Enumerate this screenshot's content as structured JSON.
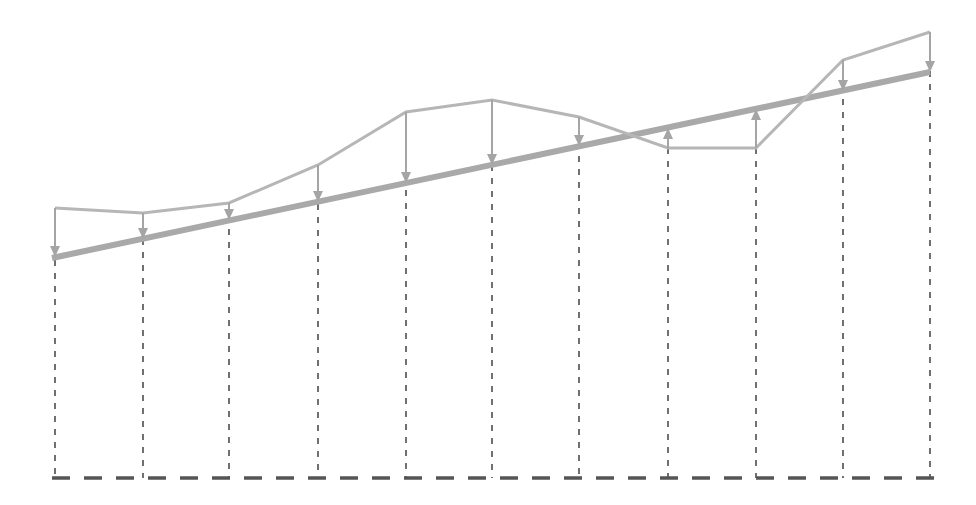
{
  "canvas": {
    "width": 976,
    "height": 505,
    "background": "#ffffff"
  },
  "colors": {
    "trend_line": "#a9a9a9",
    "series_line": "#b6b6b6",
    "arrow": "#a5a5a5",
    "guide_line": "#4d4d4d",
    "baseline": "#555555"
  },
  "style": {
    "trend_width": 6,
    "series_width": 3,
    "arrow_width": 2,
    "guide_width": 1.6,
    "guide_dash": "6 7",
    "baseline_width": 3.4,
    "baseline_dash": "18 14"
  },
  "chart_data": {
    "type": "line",
    "title": "",
    "subtitle": "",
    "xlabel": "",
    "ylabel": "",
    "grid": false,
    "legend_position": "none",
    "axis_note": "No axis tick labels or numeric annotations are rendered in the figure; geometry is given in pixel coordinates of the 976x505 canvas.",
    "xlim": [
      0,
      976
    ],
    "ylim": [
      505,
      0
    ],
    "baseline": {
      "y": 478,
      "x_start": 52,
      "x_end": 935,
      "dashed": true
    },
    "categories": [
      "1",
      "2",
      "3",
      "4",
      "5",
      "6",
      "7",
      "8",
      "9",
      "10",
      "11"
    ],
    "x": [
      55,
      143,
      229,
      318,
      406,
      492,
      579,
      668,
      756,
      843,
      930
    ],
    "series": [
      {
        "name": "actual",
        "style": "zigzag-line",
        "values": [
          208,
          213,
          203,
          165,
          112,
          100,
          117,
          148,
          148,
          60,
          32
        ]
      },
      {
        "name": "trend",
        "style": "thick-straight-line",
        "endpoints": [
          {
            "x": 52,
            "y": 258
          },
          {
            "x": 930,
            "y": 72
          }
        ],
        "values": [
          257,
          239,
          220,
          202,
          183,
          165,
          146,
          128,
          109,
          91,
          72
        ]
      }
    ],
    "deviation_arrows": [
      {
        "index": 0,
        "x": 55,
        "from": 208,
        "to": 257,
        "direction": "down",
        "magnitude": 49
      },
      {
        "index": 1,
        "x": 143,
        "from": 213,
        "to": 239,
        "direction": "down",
        "magnitude": 26
      },
      {
        "index": 2,
        "x": 229,
        "from": 203,
        "to": 220,
        "direction": "down",
        "magnitude": 17
      },
      {
        "index": 3,
        "x": 318,
        "from": 165,
        "to": 202,
        "direction": "down",
        "magnitude": 37
      },
      {
        "index": 4,
        "x": 406,
        "from": 112,
        "to": 183,
        "direction": "down",
        "magnitude": 71
      },
      {
        "index": 5,
        "x": 492,
        "from": 100,
        "to": 165,
        "direction": "down",
        "magnitude": 65
      },
      {
        "index": 6,
        "x": 579,
        "from": 117,
        "to": 146,
        "direction": "down",
        "magnitude": 29
      },
      {
        "index": 7,
        "x": 668,
        "from": 148,
        "to": 128,
        "direction": "up",
        "magnitude": 20
      },
      {
        "index": 8,
        "x": 756,
        "from": 148,
        "to": 109,
        "direction": "up",
        "magnitude": 39
      },
      {
        "index": 9,
        "x": 843,
        "from": 60,
        "to": 91,
        "direction": "down",
        "magnitude": 31
      },
      {
        "index": 10,
        "x": 930,
        "from": 32,
        "to": 72,
        "direction": "down",
        "magnitude": 40
      }
    ],
    "guide_lines": [
      {
        "x": 55,
        "y_top": 208,
        "y_bottom": 478
      },
      {
        "x": 143,
        "y_top": 213,
        "y_bottom": 478
      },
      {
        "x": 229,
        "y_top": 203,
        "y_bottom": 478
      },
      {
        "x": 318,
        "y_top": 165,
        "y_bottom": 478
      },
      {
        "x": 406,
        "y_top": 112,
        "y_bottom": 478
      },
      {
        "x": 492,
        "y_top": 100,
        "y_bottom": 478
      },
      {
        "x": 579,
        "y_top": 117,
        "y_bottom": 478
      },
      {
        "x": 668,
        "y_top": 148,
        "y_bottom": 478
      },
      {
        "x": 756,
        "y_top": 148,
        "y_bottom": 478
      },
      {
        "x": 843,
        "y_top": 60,
        "y_bottom": 478
      },
      {
        "x": 930,
        "y_top": 32,
        "y_bottom": 478
      }
    ]
  }
}
